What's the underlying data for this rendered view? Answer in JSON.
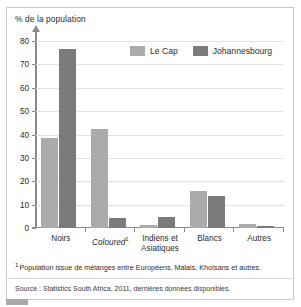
{
  "figure": {
    "axis_title": "% de la population",
    "footnote_marker": "1",
    "footnote": "Population issue de mélanges entre Européens, Malais, Khoïsans et autres.",
    "source": "Source : Statistics South Africa, 2011, dernières données disponibles."
  },
  "colors": {
    "series_le_cap": "#ababab",
    "series_johannesbourg": "#7b7b7b",
    "grid": "#e2e2e2",
    "axis": "#8a8a8a",
    "frame": "#c9c9c9"
  },
  "chart_data": {
    "type": "bar",
    "title": "",
    "xlabel": "",
    "ylabel": "% de la population",
    "ylim": [
      0,
      80
    ],
    "yticks": [
      0,
      10,
      20,
      30,
      40,
      50,
      60,
      70,
      80
    ],
    "grid": true,
    "legend_position": "top-right",
    "categories": [
      "Noirs",
      "Coloured",
      "Indiens et Asiatiques",
      "Blancs",
      "Autres"
    ],
    "category_notes": [
      "",
      "1",
      "",
      "",
      ""
    ],
    "series": [
      {
        "name": "Le Cap",
        "values": [
          38.6,
          42.4,
          1.4,
          15.7,
          1.9
        ]
      },
      {
        "name": "Johannesbourg",
        "values": [
          76.4,
          4.2,
          4.9,
          13.9,
          0.9
        ]
      }
    ]
  }
}
